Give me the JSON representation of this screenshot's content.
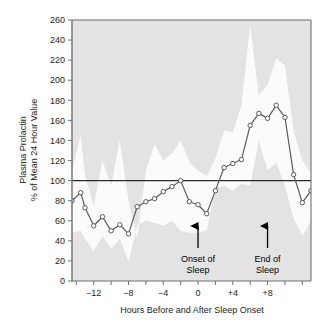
{
  "chart_data": {
    "type": "line",
    "title": "",
    "xlabel": "Hours Before and After Sleep Onset",
    "ylabel_line1": "Plasma Prolactin",
    "ylabel_line2": "% of Mean 24 Hour Value",
    "xlim": [
      -14.5,
      13.0
    ],
    "ylim": [
      0,
      260
    ],
    "grid": false,
    "legend": "none",
    "y_ticks": [
      0,
      20,
      40,
      60,
      80,
      100,
      120,
      140,
      160,
      180,
      200,
      220,
      240,
      260
    ],
    "y_tick_labels": [
      "0",
      "20",
      "40",
      "60",
      "80",
      "100",
      "120",
      "140",
      "160",
      "180",
      "200",
      "220",
      "240",
      "260"
    ],
    "x_ticks": [
      -14,
      -12,
      -10,
      -8,
      -6,
      -4,
      -2,
      0,
      2,
      4,
      6,
      8,
      10,
      12
    ],
    "x_tick_labels": [
      "",
      "−12",
      "",
      "−8",
      "",
      "−4",
      "",
      "0",
      "",
      "+4",
      "",
      "+8",
      "",
      ""
    ],
    "reference_line": {
      "value": 100,
      "label": "100% of mean 24 hour value"
    },
    "x": [
      -14.5,
      -13.5,
      -13.0,
      -12.0,
      -11.0,
      -10.0,
      -9.0,
      -8.0,
      -7.0,
      -6.0,
      -5.0,
      -4.0,
      -3.0,
      -2.0,
      -1.0,
      0.0,
      1.0,
      2.0,
      3.0,
      4.0,
      5.0,
      6.0,
      7.0,
      8.0,
      9.0,
      10.0,
      11.0,
      12.0,
      13.0
    ],
    "series": [
      {
        "name": "Mean plasma prolactin",
        "marker": "open-circle",
        "values": [
          80,
          88,
          73,
          55,
          64,
          50,
          56,
          47,
          74,
          79,
          82,
          89,
          94,
          100,
          79,
          76,
          67,
          90,
          113,
          117,
          121,
          155,
          167,
          162,
          175,
          163,
          106,
          78,
          90
        ]
      },
      {
        "name": "Upper band (mean + SEM)",
        "kind": "band-upper",
        "values": [
          110,
          145,
          105,
          75,
          120,
          95,
          140,
          80,
          42,
          110,
          136,
          120,
          127,
          140,
          118,
          110,
          104,
          122,
          150,
          148,
          175,
          255,
          185,
          195,
          222,
          215,
          150,
          120,
          108
        ]
      },
      {
        "name": "Lower band (mean − SEM)",
        "kind": "band-lower",
        "values": [
          48,
          50,
          42,
          30,
          45,
          32,
          42,
          19,
          55,
          60,
          58,
          55,
          60,
          50,
          48,
          48,
          50,
          93,
          95,
          90,
          97,
          95,
          140,
          110,
          118,
          95,
          62,
          45,
          60
        ]
      }
    ],
    "annotations": [
      {
        "id": "onset",
        "label_line1": "Onset of",
        "label_line2": "Sleep",
        "x": 0,
        "arrow": "up"
      },
      {
        "id": "end",
        "label_line1": "End of",
        "label_line2": "Sleep",
        "x": 8,
        "arrow": "up"
      }
    ],
    "colors": {
      "plot_background": "#e3e3e3",
      "band_fill": "#fbfbfb",
      "line": "#5d5d5d",
      "marker_fill": "#ffffff",
      "marker_stroke": "#4a4a4a",
      "axis": "#6f6f6f",
      "reference_line": "#2b2b2b",
      "text": "#231f20",
      "page_background": "#ffffff"
    }
  }
}
